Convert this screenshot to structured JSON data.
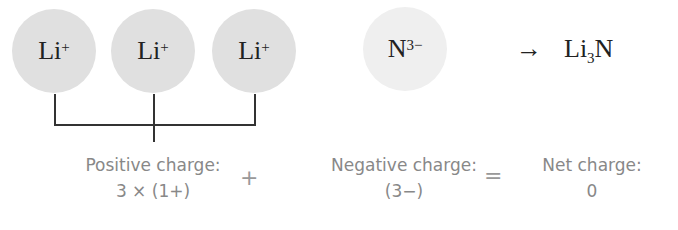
{
  "colors": {
    "cation_fill": "#e0e0e0",
    "anion_fill": "#efefef",
    "line": "#333333",
    "label_text": "#888888"
  },
  "ions": [
    {
      "symbol": "Li",
      "charge": "+"
    },
    {
      "symbol": "Li",
      "charge": "+"
    },
    {
      "symbol": "Li",
      "charge": "+"
    },
    {
      "symbol": "N",
      "charge": "3−"
    }
  ],
  "reaction": {
    "arrow": "→",
    "product_prefix": "Li",
    "product_subscript": "3",
    "product_suffix": "N"
  },
  "charges": {
    "positive": {
      "title": "Positive charge:",
      "value": "3 × (1+)"
    },
    "plus": "+",
    "negative": {
      "title": "Negative charge:",
      "value": "(3−)"
    },
    "equals": "=",
    "net": {
      "title": "Net charge:",
      "value": "0"
    }
  }
}
